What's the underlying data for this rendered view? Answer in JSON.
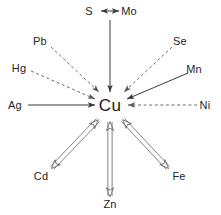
{
  "diagram": {
    "center": {
      "id": "cu",
      "label": "Cu",
      "x": 110,
      "y": 106
    },
    "colors": {
      "line": "#3a3a3a",
      "dashed_line": "#5a5a5a",
      "double_line": "#707070",
      "text": "#262626",
      "background": "#ffffff"
    },
    "nodes": [
      {
        "id": "s",
        "label": "S",
        "x": 89,
        "y": 11,
        "arrow_style": "solid-double-head-horizontal"
      },
      {
        "id": "mo",
        "label": "Mo",
        "x": 129,
        "y": 11,
        "arrow_style": "solid-double-head-horizontal"
      },
      {
        "id": "pb",
        "label": "Pb",
        "x": 40,
        "y": 41,
        "arrow_style": "dashed-to-center"
      },
      {
        "id": "se",
        "label": "Se",
        "x": 180,
        "y": 41,
        "arrow_style": "dashed-to-center"
      },
      {
        "id": "hg",
        "label": "Hg",
        "x": 19,
        "y": 68,
        "arrow_style": "dashed-to-center"
      },
      {
        "id": "mn",
        "label": "Mn",
        "x": 194,
        "y": 69,
        "arrow_style": "solid-to-center"
      },
      {
        "id": "ag",
        "label": "Ag",
        "x": 15,
        "y": 105,
        "arrow_style": "solid-to-center"
      },
      {
        "id": "ni",
        "label": "Ni",
        "x": 205,
        "y": 105,
        "arrow_style": "dashed-to-center"
      },
      {
        "id": "cd",
        "label": "Cd",
        "x": 41,
        "y": 176,
        "arrow_style": "double-shaft-bidirectional"
      },
      {
        "id": "zn",
        "label": "Zn",
        "x": 110,
        "y": 204,
        "arrow_style": "double-shaft-bidirectional"
      },
      {
        "id": "fe",
        "label": "Fe",
        "x": 179,
        "y": 176,
        "arrow_style": "double-shaft-bidirectional"
      }
    ],
    "edges": [
      {
        "id": "edge-s-mo",
        "from": "s",
        "to": "mo",
        "style": "solid",
        "heads": "both"
      },
      {
        "id": "edge-smo-cu",
        "from": "s-mo-midpoint",
        "to": "cu",
        "style": "solid",
        "heads": "end"
      },
      {
        "id": "edge-pb-cu",
        "from": "pb",
        "to": "cu",
        "style": "dashed",
        "heads": "end"
      },
      {
        "id": "edge-hg-cu",
        "from": "hg",
        "to": "cu",
        "style": "dashed",
        "heads": "end"
      },
      {
        "id": "edge-ag-cu",
        "from": "ag",
        "to": "cu",
        "style": "solid",
        "heads": "end"
      },
      {
        "id": "edge-se-cu",
        "from": "se",
        "to": "cu",
        "style": "dashed",
        "heads": "end"
      },
      {
        "id": "edge-mn-cu",
        "from": "mn",
        "to": "cu",
        "style": "solid",
        "heads": "end"
      },
      {
        "id": "edge-ni-cu",
        "from": "ni",
        "to": "cu",
        "style": "dashed",
        "heads": "end"
      },
      {
        "id": "edge-cd-cu",
        "from": "cd",
        "to": "cu",
        "style": "double-shaft",
        "heads": "both"
      },
      {
        "id": "edge-zn-cu",
        "from": "zn",
        "to": "cu",
        "style": "double-shaft",
        "heads": "both"
      },
      {
        "id": "edge-fe-cu",
        "from": "fe",
        "to": "cu",
        "style": "double-shaft",
        "heads": "both"
      }
    ]
  }
}
